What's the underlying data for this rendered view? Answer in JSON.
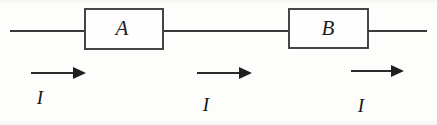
{
  "figure": {
    "kind": "circuit-diagram",
    "width": 437,
    "height": 125,
    "background_color": "#fdfdfc",
    "line_color": "#3a3a3a",
    "text_color": "#1d1d1d"
  },
  "components": [
    {
      "id": "A",
      "label": "A",
      "x": 85,
      "y": 9,
      "width": 78,
      "height": 40,
      "label_x": 122,
      "label_y": 30
    },
    {
      "id": "B",
      "label": "B",
      "x": 289,
      "y": 9,
      "width": 79,
      "height": 39,
      "label_x": 328,
      "label_y": 30
    }
  ],
  "wires": [
    {
      "id": "wire-left",
      "x1": 10,
      "y1": 31,
      "x2": 85,
      "y2": 31
    },
    {
      "id": "wire-middle",
      "x1": 163,
      "y1": 31,
      "x2": 289,
      "y2": 31
    },
    {
      "id": "wire-right",
      "x1": 368,
      "y1": 31,
      "x2": 427,
      "y2": 31
    }
  ],
  "current_arrows": [
    {
      "id": "current-arrow-1",
      "label": "I",
      "shaft_x1": 31,
      "shaft_x2": 74,
      "shaft_y": 73,
      "tip_x": 86,
      "head_half_height": 6,
      "label_x": 40,
      "label_y": 100
    },
    {
      "id": "current-arrow-2",
      "label": "I",
      "shaft_x1": 197,
      "shaft_x2": 240,
      "shaft_y": 73,
      "tip_x": 252,
      "head_half_height": 6,
      "label_x": 206,
      "label_y": 107
    },
    {
      "id": "current-arrow-3",
      "label": "I",
      "shaft_x1": 351,
      "shaft_x2": 392,
      "shaft_y": 71,
      "tip_x": 404,
      "head_half_height": 6,
      "label_x": 361,
      "label_y": 108
    }
  ]
}
